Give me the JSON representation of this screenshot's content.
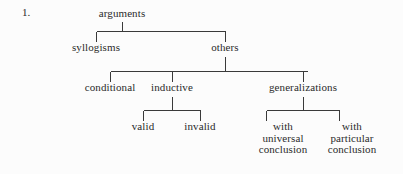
{
  "page": {
    "item_number": "1.",
    "background_color": "#fcfcfc",
    "line_color": "#3a3a3a",
    "text_color": "#2b2b2b"
  },
  "tree": {
    "title": "arguments",
    "nodes": [
      {
        "id": "arguments",
        "label": "arguments",
        "level": 0,
        "x": 122,
        "y": 8,
        "lines": [
          "arguments"
        ]
      },
      {
        "id": "syllogisms",
        "label": "syllogisms",
        "level": 1,
        "x": 96,
        "y": 42,
        "lines": [
          "syllogisms"
        ]
      },
      {
        "id": "others",
        "label": "others",
        "level": 1,
        "x": 225,
        "y": 42,
        "lines": [
          "others"
        ]
      },
      {
        "id": "conditional",
        "label": "conditional",
        "level": 2,
        "x": 110,
        "y": 82,
        "lines": [
          "conditional"
        ]
      },
      {
        "id": "inductive",
        "label": "inductive",
        "level": 2,
        "x": 172,
        "y": 82,
        "lines": [
          "inductive"
        ]
      },
      {
        "id": "generalizations",
        "label": "generalizations",
        "level": 2,
        "x": 303,
        "y": 82,
        "lines": [
          "generalizations"
        ]
      },
      {
        "id": "valid",
        "label": "valid",
        "level": 3,
        "x": 143,
        "y": 121,
        "lines": [
          "valid"
        ]
      },
      {
        "id": "invalid",
        "label": "invalid",
        "level": 3,
        "x": 200,
        "y": 121,
        "lines": [
          "invalid"
        ]
      },
      {
        "id": "with-universal-conclusion",
        "label": "with universal conclusion",
        "level": 3,
        "x": 283,
        "y": 121,
        "lines": [
          "with",
          "universal",
          "conclusion"
        ]
      },
      {
        "id": "with-particular-conclusion",
        "label": "with particular conclusion",
        "level": 3,
        "x": 352,
        "y": 121,
        "lines": [
          "with",
          "particular",
          "conclusion"
        ]
      }
    ],
    "edges": [
      {
        "from": "arguments",
        "to": "syllogisms"
      },
      {
        "from": "arguments",
        "to": "others"
      },
      {
        "from": "others",
        "to": "conditional"
      },
      {
        "from": "others",
        "to": "inductive"
      },
      {
        "from": "others",
        "to": "generalizations"
      },
      {
        "from": "inductive",
        "to": "valid"
      },
      {
        "from": "inductive",
        "to": "invalid"
      },
      {
        "from": "generalizations",
        "to": "with-universal-conclusion"
      },
      {
        "from": "generalizations",
        "to": "with-particular-conclusion"
      }
    ]
  },
  "labels": {
    "arguments": "arguments",
    "syllogisms": "syllogisms",
    "others": "others",
    "conditional": "conditional",
    "inductive": "inductive",
    "generalizations": "generalizations",
    "valid": "valid",
    "invalid": "invalid",
    "with_universal_1": "with",
    "with_universal_2": "universal",
    "with_universal_3": "conclusion",
    "with_particular_1": "with",
    "with_particular_2": "particular",
    "with_particular_3": "conclusion"
  }
}
